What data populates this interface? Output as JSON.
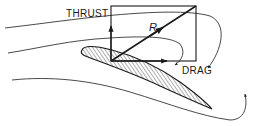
{
  "diagram": {
    "type": "airfoil-force-diagram",
    "labels": {
      "thrust": "THRUST",
      "resultant": "R",
      "drag": "DRAG"
    },
    "elements": {
      "airfoil": "hatched airfoil cross-section, leading edge upper-left, trailing edge lower-right",
      "force_rectangle": "vector parallelogram with thrust (vertical up), drag (horizontal right), resultant R (diagonal)",
      "streamlines": 3
    },
    "colors": {
      "ink": "#1a1a1a",
      "background": "#ffffff"
    }
  }
}
